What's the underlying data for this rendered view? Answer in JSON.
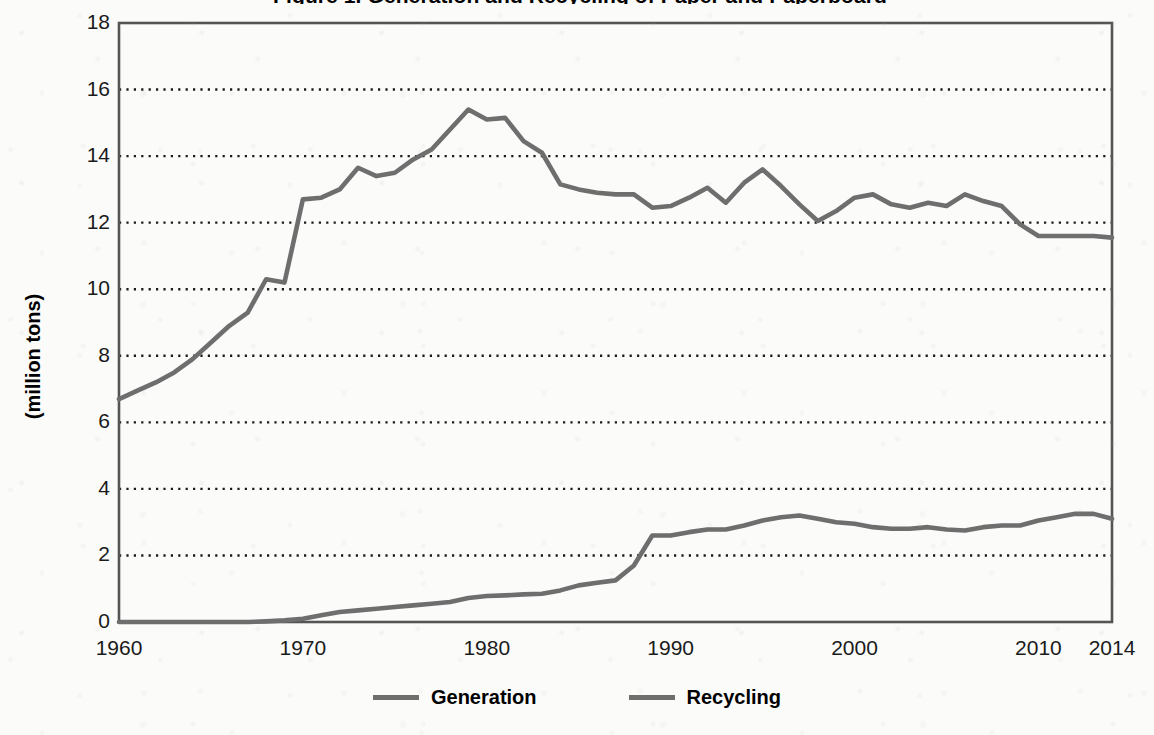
{
  "title": "Figure 1. Generation and Recycling of Paper and Paperboard",
  "y_axis_title": "(million tons)",
  "legend": {
    "generation_label": "Generation",
    "recycling_label": "Recycling"
  },
  "axis": {
    "y_ticks": [
      "0",
      "2",
      "4",
      "6",
      "8",
      "10",
      "12",
      "14",
      "16",
      "18"
    ],
    "x_ticks": [
      "1960",
      "1970",
      "1980",
      "1990",
      "2000",
      "2010",
      "2014"
    ]
  },
  "colors": {
    "line": "#6e6e6e",
    "axis": "#555555",
    "grid": "#1a1a1a",
    "background": "#fbfbfa"
  },
  "chart_data": {
    "type": "line",
    "title": "Figure 1. Generation and Recycling of Paper and Paperboard",
    "xlabel": "",
    "ylabel": "(million tons)",
    "xlim": [
      1960,
      2014
    ],
    "ylim": [
      0,
      18
    ],
    "ytick_step": 2,
    "xticks": [
      1960,
      1970,
      1980,
      1990,
      2000,
      2010,
      2014
    ],
    "yticks": [
      0,
      2,
      4,
      6,
      8,
      10,
      12,
      14,
      16,
      18
    ],
    "grid": "horizontal-dotted",
    "legend_position": "bottom-center",
    "x": [
      1960,
      1961,
      1962,
      1963,
      1964,
      1965,
      1966,
      1967,
      1968,
      1969,
      1970,
      1971,
      1972,
      1973,
      1974,
      1975,
      1976,
      1977,
      1978,
      1979,
      1980,
      1981,
      1982,
      1983,
      1984,
      1985,
      1986,
      1987,
      1988,
      1989,
      1990,
      1991,
      1992,
      1993,
      1994,
      1995,
      1996,
      1997,
      1998,
      1999,
      2000,
      2001,
      2002,
      2003,
      2004,
      2005,
      2006,
      2007,
      2008,
      2009,
      2010,
      2011,
      2012,
      2013,
      2014
    ],
    "series": [
      {
        "name": "Generation",
        "values": [
          6.7,
          6.95,
          7.2,
          7.5,
          7.9,
          8.4,
          8.9,
          9.3,
          10.3,
          10.2,
          12.7,
          12.75,
          13.0,
          13.65,
          13.4,
          13.5,
          13.9,
          14.2,
          14.8,
          15.4,
          15.1,
          15.15,
          14.45,
          14.1,
          13.15,
          13.0,
          12.9,
          12.85,
          12.85,
          12.45,
          12.5,
          12.75,
          13.05,
          12.6,
          13.2,
          13.6,
          13.1,
          12.55,
          12.05,
          12.35,
          12.75,
          12.85,
          12.55,
          12.45,
          12.6,
          12.5,
          12.85,
          12.65,
          12.5,
          11.95,
          11.6,
          11.6,
          11.6,
          11.6,
          11.55
        ],
        "color": "#6e6e6e"
      },
      {
        "name": "Recycling",
        "values": [
          0.0,
          0.0,
          0.0,
          0.0,
          0.0,
          0.0,
          0.0,
          0.0,
          0.02,
          0.05,
          0.1,
          0.2,
          0.3,
          0.35,
          0.4,
          0.45,
          0.5,
          0.55,
          0.6,
          0.72,
          0.78,
          0.8,
          0.83,
          0.85,
          0.95,
          1.1,
          1.18,
          1.25,
          1.7,
          2.6,
          2.6,
          2.7,
          2.78,
          2.78,
          2.9,
          3.05,
          3.15,
          3.2,
          3.1,
          3.0,
          2.95,
          2.85,
          2.8,
          2.8,
          2.85,
          2.78,
          2.75,
          2.85,
          2.9,
          2.9,
          3.05,
          3.15,
          3.25,
          3.25,
          3.1
        ],
        "color": "#6e6e6e"
      }
    ]
  }
}
